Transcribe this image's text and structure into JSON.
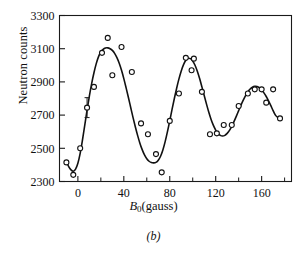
{
  "figure": {
    "caption": "(b)",
    "ylabel": "Neutron counts",
    "xlabel_symbol": "B",
    "xlabel_subscript": "0",
    "xlabel_units": "(gauss)"
  },
  "chart_data": {
    "type": "scatter",
    "title": "",
    "subtitle": "",
    "xlabel": "B0(gauss)",
    "ylabel": "Neutron counts",
    "xlim": [
      -16,
      186
    ],
    "ylim": [
      2300,
      3300
    ],
    "xticks": [
      0,
      40,
      80,
      120,
      160
    ],
    "xtick_labels": [
      "0",
      "40",
      "80",
      "120",
      "160"
    ],
    "xticks_minor": [
      -20,
      20,
      60,
      100,
      140,
      180
    ],
    "yticks": [
      2300,
      2500,
      2700,
      2900,
      3100,
      3300
    ],
    "ytick_labels": [
      "2300",
      "2500",
      "2700",
      "2900",
      "3100",
      "3300"
    ],
    "grid": false,
    "legend": "none",
    "frame": "box",
    "tick_direction": "in",
    "marker": "open-circle",
    "marker_color": "#111111",
    "curve_color": "#111111",
    "points": [
      {
        "x": -10,
        "y": 2415
      },
      {
        "x": -4,
        "y": 2340
      },
      {
        "x": 2,
        "y": 2500
      },
      {
        "x": 8,
        "y": 2745,
        "yerr": 60
      },
      {
        "x": 14,
        "y": 2870
      },
      {
        "x": 21,
        "y": 3075
      },
      {
        "x": 26,
        "y": 3165
      },
      {
        "x": 30,
        "y": 2940
      },
      {
        "x": 38,
        "y": 3110
      },
      {
        "x": 47,
        "y": 2960
      },
      {
        "x": 55,
        "y": 2650
      },
      {
        "x": 61,
        "y": 2585
      },
      {
        "x": 68,
        "y": 2465
      },
      {
        "x": 73,
        "y": 2355
      },
      {
        "x": 80,
        "y": 2665
      },
      {
        "x": 88,
        "y": 2830
      },
      {
        "x": 94,
        "y": 3045
      },
      {
        "x": 99,
        "y": 2970
      },
      {
        "x": 101,
        "y": 3040
      },
      {
        "x": 108,
        "y": 2840
      },
      {
        "x": 115,
        "y": 2585
      },
      {
        "x": 121,
        "y": 2590
      },
      {
        "x": 127,
        "y": 2640
      },
      {
        "x": 134,
        "y": 2640
      },
      {
        "x": 140,
        "y": 2755
      },
      {
        "x": 148,
        "y": 2830
      },
      {
        "x": 154,
        "y": 2855
      },
      {
        "x": 160,
        "y": 2855
      },
      {
        "x": 164,
        "y": 2775
      },
      {
        "x": 170,
        "y": 2855
      },
      {
        "x": 176,
        "y": 2680
      }
    ],
    "fit_curve": {
      "description": "damped sinusoidal fit through neutron count oscillations",
      "x": [
        -10,
        -8,
        -6,
        -4,
        -2,
        0,
        2,
        4,
        6,
        8,
        10,
        12,
        14,
        16,
        18,
        20,
        22,
        24,
        26,
        28,
        30,
        32,
        34,
        36,
        38,
        40,
        42,
        44,
        46,
        48,
        50,
        52,
        54,
        56,
        58,
        60,
        62,
        64,
        66,
        68,
        70,
        72,
        74,
        76,
        78,
        80,
        82,
        84,
        86,
        88,
        90,
        92,
        94,
        96,
        98,
        100,
        102,
        104,
        106,
        108,
        110,
        112,
        114,
        116,
        118,
        120,
        122,
        124,
        126,
        128,
        130,
        132,
        134,
        136,
        138,
        140,
        142,
        144,
        146,
        148,
        150,
        152,
        154,
        156,
        158,
        160,
        162,
        164,
        166,
        168,
        170,
        172,
        174,
        176
      ],
      "y": [
        2420,
        2390,
        2370,
        2362,
        2375,
        2410,
        2470,
        2550,
        2640,
        2730,
        2815,
        2890,
        2955,
        3010,
        3052,
        3080,
        3096,
        3104,
        3105,
        3100,
        3090,
        3072,
        3046,
        3012,
        2970,
        2920,
        2864,
        2806,
        2746,
        2686,
        2630,
        2578,
        2531,
        2492,
        2460,
        2437,
        2422,
        2414,
        2412,
        2415,
        2428,
        2452,
        2490,
        2540,
        2600,
        2666,
        2734,
        2800,
        2862,
        2918,
        2966,
        3004,
        3030,
        3042,
        3040,
        3026,
        3000,
        2964,
        2920,
        2870,
        2818,
        2766,
        2717,
        2674,
        2638,
        2610,
        2590,
        2578,
        2574,
        2578,
        2590,
        2608,
        2632,
        2662,
        2694,
        2727,
        2760,
        2790,
        2817,
        2840,
        2857,
        2868,
        2873,
        2872,
        2865,
        2852,
        2834,
        2812,
        2786,
        2757,
        2727,
        2700,
        2686,
        2680
      ]
    }
  }
}
